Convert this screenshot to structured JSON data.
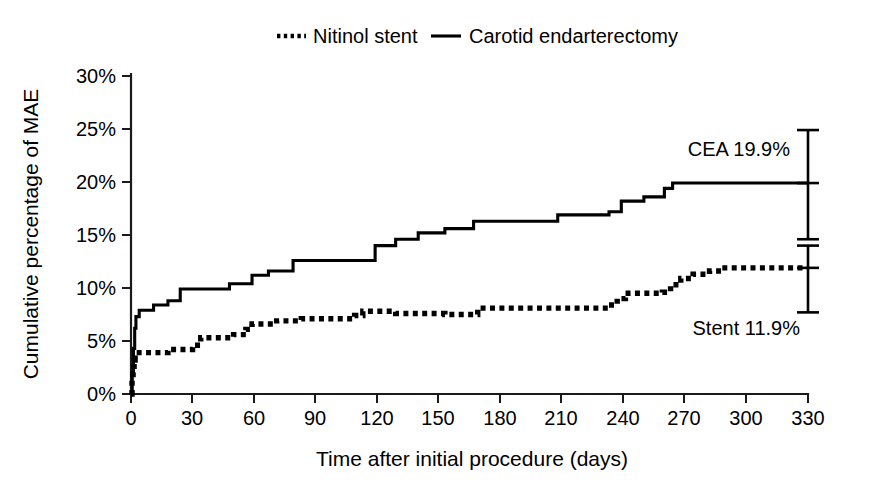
{
  "chart_data": {
    "type": "line",
    "title": "",
    "subtitle": "",
    "xlabel": "Time after initial procedure (days)",
    "ylabel": "Cumulative percentage of MAE",
    "xlim": [
      0,
      330
    ],
    "ylim": [
      0,
      30
    ],
    "grid": false,
    "legend_position": "top-center",
    "x_ticks": [
      0,
      30,
      60,
      90,
      120,
      150,
      180,
      210,
      240,
      270,
      300,
      330
    ],
    "x_tick_labels": [
      "0",
      "30",
      "60",
      "90",
      "120",
      "150",
      "180",
      "210",
      "240",
      "270",
      "300",
      "330"
    ],
    "y_ticks": [
      0,
      5,
      10,
      15,
      20,
      25,
      30
    ],
    "y_tick_labels": [
      "0%",
      "5%",
      "10%",
      "15%",
      "20%",
      "25%",
      "30%"
    ],
    "legend": [
      {
        "name": "Nitinol stent",
        "style": "dotted"
      },
      {
        "name": "Carotid endarterectomy",
        "style": "solid"
      }
    ],
    "series": [
      {
        "name": "Carotid endarterectomy",
        "style": "solid",
        "final_value": 19.9,
        "points": [
          [
            0,
            0.0
          ],
          [
            0.6,
            2.0
          ],
          [
            1.2,
            4.3
          ],
          [
            1.8,
            6.2
          ],
          [
            2.4,
            7.3
          ],
          [
            4,
            7.9
          ],
          [
            10,
            7.9
          ],
          [
            11,
            8.4
          ],
          [
            17,
            8.4
          ],
          [
            18,
            8.8
          ],
          [
            23,
            8.8
          ],
          [
            24,
            9.9
          ],
          [
            47,
            9.9
          ],
          [
            48,
            10.4
          ],
          [
            58,
            10.4
          ],
          [
            59,
            11.2
          ],
          [
            66,
            11.2
          ],
          [
            67,
            11.6
          ],
          [
            78,
            11.6
          ],
          [
            79,
            12.6
          ],
          [
            118,
            12.6
          ],
          [
            119,
            14.0
          ],
          [
            128,
            14.0
          ],
          [
            129,
            14.6
          ],
          [
            139,
            14.6
          ],
          [
            140,
            15.2
          ],
          [
            152,
            15.2
          ],
          [
            153,
            15.6
          ],
          [
            166,
            15.6
          ],
          [
            167,
            16.3
          ],
          [
            207,
            16.3
          ],
          [
            208,
            16.9
          ],
          [
            232,
            16.9
          ],
          [
            233,
            17.2
          ],
          [
            238,
            17.2
          ],
          [
            239,
            18.2
          ],
          [
            249,
            18.2
          ],
          [
            250,
            18.6
          ],
          [
            259,
            18.6
          ],
          [
            260,
            19.4
          ],
          [
            263,
            19.4
          ],
          [
            264,
            19.9
          ],
          [
            330,
            19.9
          ]
        ]
      },
      {
        "name": "Nitinol stent",
        "style": "dotted",
        "final_value": 11.9,
        "points": [
          [
            0,
            0.0
          ],
          [
            0.5,
            1.5
          ],
          [
            1.0,
            2.3
          ],
          [
            1.5,
            3.2
          ],
          [
            2.0,
            3.9
          ],
          [
            17,
            3.9
          ],
          [
            18,
            4.2
          ],
          [
            29,
            4.2
          ],
          [
            30,
            4.6
          ],
          [
            33,
            4.6
          ],
          [
            34,
            5.3
          ],
          [
            49,
            5.3
          ],
          [
            50,
            5.6
          ],
          [
            55,
            5.6
          ],
          [
            56,
            6.1
          ],
          [
            58,
            6.1
          ],
          [
            59,
            6.6
          ],
          [
            70,
            6.6
          ],
          [
            71,
            6.9
          ],
          [
            82,
            6.9
          ],
          [
            83,
            7.1
          ],
          [
            108,
            7.1
          ],
          [
            109,
            7.4
          ],
          [
            112,
            7.4
          ],
          [
            113,
            7.8
          ],
          [
            128,
            7.8
          ],
          [
            129,
            7.6
          ],
          [
            152,
            7.6
          ],
          [
            153,
            7.5
          ],
          [
            168,
            7.5
          ],
          [
            169,
            8.1
          ],
          [
            232,
            8.1
          ],
          [
            233,
            8.4
          ],
          [
            236,
            8.4
          ],
          [
            237,
            9.0
          ],
          [
            240,
            9.0
          ],
          [
            241,
            9.5
          ],
          [
            258,
            9.5
          ],
          [
            259,
            9.6
          ],
          [
            262,
            9.6
          ],
          [
            263,
            10.3
          ],
          [
            267,
            10.3
          ],
          [
            268,
            10.9
          ],
          [
            273,
            10.9
          ],
          [
            274,
            11.3
          ],
          [
            281,
            11.3
          ],
          [
            282,
            11.6
          ],
          [
            287,
            11.6
          ],
          [
            288,
            11.9
          ],
          [
            330,
            11.9
          ]
        ]
      }
    ],
    "error_bars": [
      {
        "name": "Carotid endarterectomy",
        "x": 330,
        "center": 19.9,
        "low": 14.6,
        "high": 24.9
      },
      {
        "name": "Nitinol stent",
        "x": 330,
        "center": 11.9,
        "low": 7.7,
        "high": 14.0
      }
    ],
    "annotations": [
      {
        "name": "cea-final-label",
        "text": "CEA 19.9%",
        "x": 330,
        "y": 22.3,
        "align": "end"
      },
      {
        "name": "stent-final-label",
        "text": "Stent 11.9%",
        "x": 330,
        "y": 6.6,
        "align": "end"
      }
    ]
  }
}
